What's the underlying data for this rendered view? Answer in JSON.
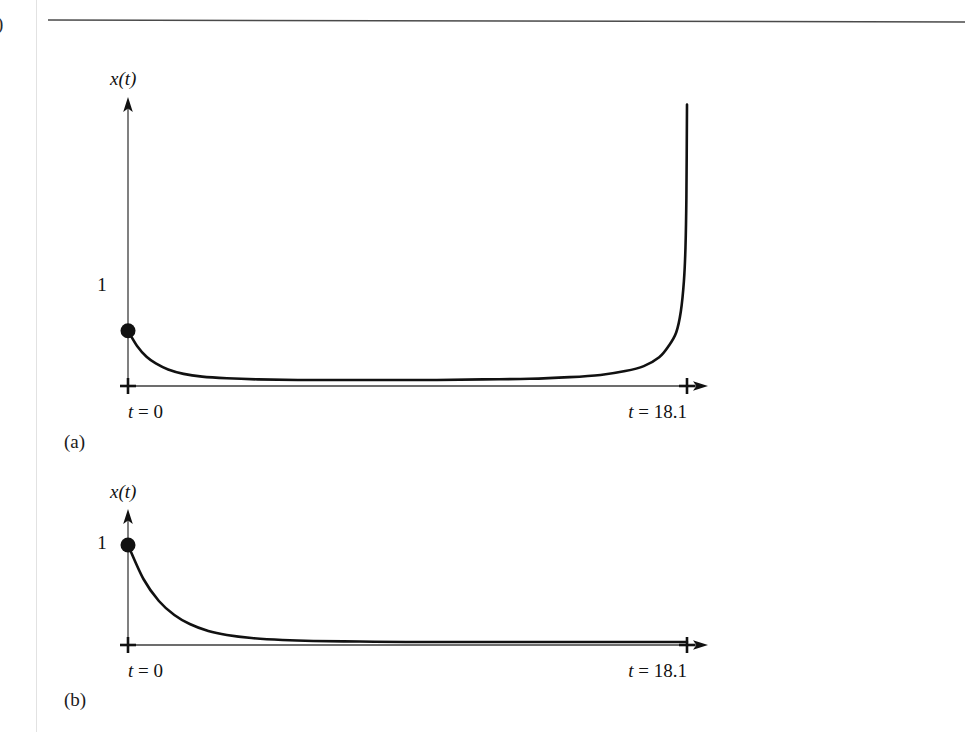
{
  "page": {
    "background_color": "#ffffff",
    "margin_glyph": ")",
    "rule_color": "#4a4a4a",
    "margin_line_color": "#e2e2e2"
  },
  "figures": [
    {
      "caption": "(a)",
      "y_axis_label": "x(t)",
      "y_value_label": "1",
      "x_start_label": "t = 0",
      "x_end_label": "t = 18.1",
      "curve_color": "#111111",
      "axis_color": "#3c3c3c",
      "marker": {
        "name": "initial-condition-dot",
        "value": "1"
      }
    },
    {
      "caption": "(b)",
      "y_axis_label": "x(t)",
      "y_value_label": "1",
      "x_start_label": "t = 0",
      "x_end_label": "t = 18.1",
      "curve_color": "#111111",
      "axis_color": "#3c3c3c",
      "marker": {
        "name": "initial-condition-dot",
        "value": "1"
      }
    }
  ],
  "chart_data": [
    {
      "type": "line",
      "title": "(a)",
      "xlabel": "t",
      "ylabel": "x(t)",
      "xlim": [
        0,
        18.1
      ],
      "ylim": [
        0,
        5.2
      ],
      "grid": false,
      "legend": null,
      "xtick_labels": [
        "t = 0",
        "t = 18.1"
      ],
      "xticks": [
        0,
        18.1
      ],
      "ytick_labels": [
        "1"
      ],
      "yticks": [
        1
      ],
      "annotations": [
        "initial point at (0, 1)"
      ],
      "series": [
        {
          "name": "x(t) with finite-time blow-up",
          "x": [
            0,
            0.3,
            0.6,
            0.9,
            1.3,
            1.8,
            2.4,
            3.2,
            4.2,
            5.5,
            7.0,
            8.5,
            10.0,
            11.5,
            13.0,
            14.3,
            15.3,
            16.1,
            16.7,
            17.2,
            17.5,
            17.75,
            17.9,
            18.0,
            18.05,
            18.08,
            18.1
          ],
          "y": [
            1.0,
            0.72,
            0.53,
            0.41,
            0.3,
            0.22,
            0.17,
            0.14,
            0.12,
            0.11,
            0.11,
            0.11,
            0.11,
            0.12,
            0.13,
            0.16,
            0.2,
            0.27,
            0.36,
            0.52,
            0.72,
            0.97,
            1.35,
            1.9,
            2.5,
            3.4,
            5.1
          ]
        }
      ]
    },
    {
      "type": "line",
      "title": "(b)",
      "xlabel": "t",
      "ylabel": "x(t)",
      "xlim": [
        0,
        18.1
      ],
      "ylim": [
        0,
        1.25
      ],
      "grid": false,
      "legend": null,
      "xtick_labels": [
        "t = 0",
        "t = 18.1"
      ],
      "xticks": [
        0,
        18.1
      ],
      "ytick_labels": [
        "1"
      ],
      "yticks": [
        1
      ],
      "annotations": [
        "initial point at (0, 1)"
      ],
      "series": [
        {
          "name": "x(t) exponential decay",
          "x": [
            0,
            0.5,
            1.0,
            1.5,
            2.0,
            2.6,
            3.2,
            4.0,
            5.0,
            6.0,
            7.5,
            9.0,
            11.0,
            13.0,
            15.0,
            16.5,
            18.1
          ],
          "y": [
            1.0,
            0.66,
            0.44,
            0.3,
            0.21,
            0.14,
            0.1,
            0.07,
            0.05,
            0.04,
            0.035,
            0.03,
            0.03,
            0.03,
            0.03,
            0.03,
            0.03
          ]
        }
      ]
    }
  ]
}
